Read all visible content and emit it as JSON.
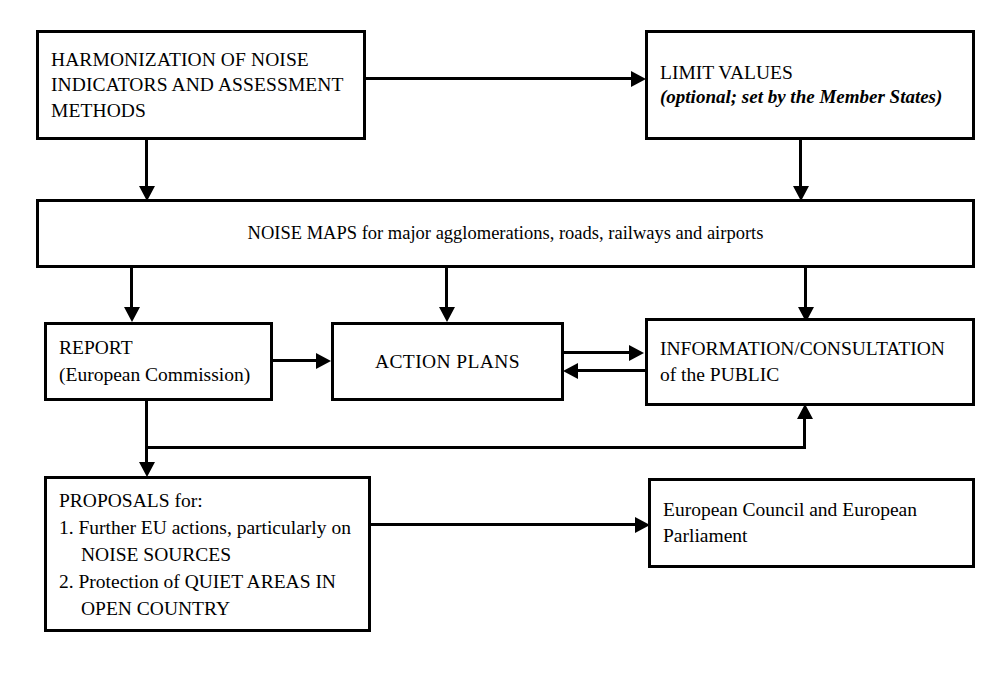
{
  "diagram": {
    "nodes": {
      "harmonization": {
        "line1": "HARMONIZATION OF NOISE",
        "line2": "INDICATORS AND ASSESSMENT",
        "line3": "METHODS"
      },
      "limit_values": {
        "line1": "LIMIT VALUES",
        "line2": "(optional; set by the Member States)"
      },
      "noise_maps": {
        "line1": "NOISE MAPS for major agglomerations, roads, railways and airports"
      },
      "report": {
        "line1": "REPORT",
        "line2": "(European Commission)"
      },
      "action_plans": {
        "line1": "ACTION PLANS"
      },
      "information": {
        "line1": "INFORMATION/CONSULTATION",
        "line2": "of the PUBLIC"
      },
      "proposals": {
        "line1": "PROPOSALS for:",
        "line2": "1. Further EU actions, particularly on",
        "line3": "NOISE SOURCES",
        "line4": "2. Protection of QUIET AREAS IN",
        "line5": "OPEN COUNTRY"
      },
      "council": {
        "line1": "European Council and European",
        "line2": "Parliament"
      }
    },
    "colors": {
      "stroke": "#000000",
      "fill": "#ffffff",
      "text": "#000000"
    }
  }
}
